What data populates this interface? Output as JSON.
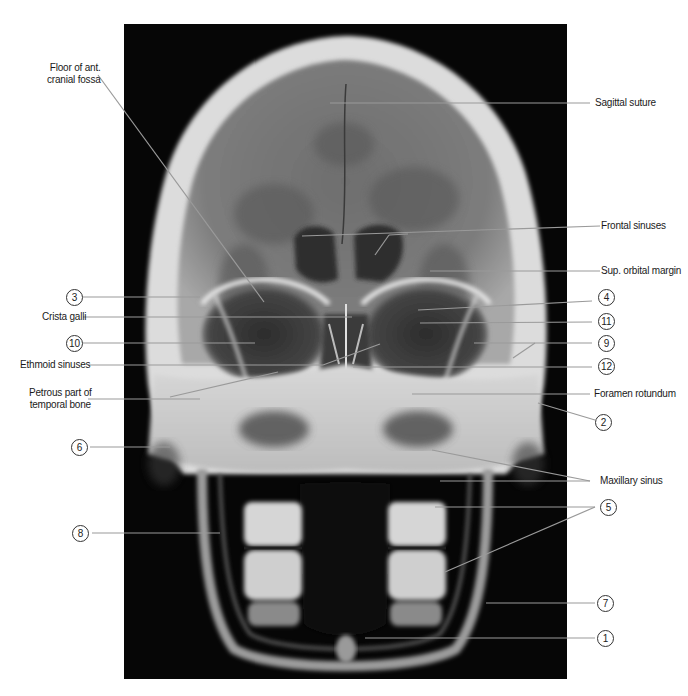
{
  "figure": {
    "background_color": "#ffffff",
    "image_background": "#060606"
  },
  "labels_left": [
    {
      "id": "floor-ant-cranial-fossa",
      "text_line1": "Floor of ant.",
      "text_line2": "cranial fossa"
    },
    {
      "id": "num-3",
      "text": "3"
    },
    {
      "id": "crista-galli",
      "text": "Crista galli"
    },
    {
      "id": "num-10",
      "text": "10"
    },
    {
      "id": "ethmoid-sinuses",
      "text": "Ethmoid sinuses"
    },
    {
      "id": "petrous-part",
      "text_line1": "Petrous part of",
      "text_line2": "temporal bone"
    },
    {
      "id": "num-6",
      "text": "6"
    },
    {
      "id": "num-8",
      "text": "8"
    }
  ],
  "labels_right": [
    {
      "id": "sagittal-suture",
      "text": "Sagittal suture"
    },
    {
      "id": "frontal-sinuses",
      "text": "Frontal sinuses"
    },
    {
      "id": "sup-orbital-margin",
      "text": "Sup. orbital margin"
    },
    {
      "id": "num-4",
      "text": "4"
    },
    {
      "id": "num-11",
      "text": "11"
    },
    {
      "id": "num-9",
      "text": "9"
    },
    {
      "id": "num-12",
      "text": "12"
    },
    {
      "id": "foramen-rotundum",
      "text": "Foramen rotundum"
    },
    {
      "id": "num-2",
      "text": "2"
    },
    {
      "id": "maxillary-sinus",
      "text": "Maxillary sinus"
    },
    {
      "id": "num-5",
      "text": "5"
    },
    {
      "id": "num-7",
      "text": "7"
    },
    {
      "id": "num-1",
      "text": "1"
    }
  ],
  "leader_color": "#9a9a9a"
}
